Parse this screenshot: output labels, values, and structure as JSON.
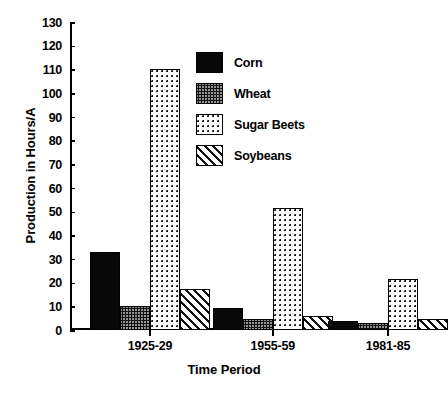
{
  "chart_data": {
    "type": "bar",
    "title": "",
    "xlabel": "Time Period",
    "ylabel": "Production in Hours/A",
    "categories": [
      "1925-29",
      "1955-59",
      "1981-85"
    ],
    "ylim": [
      0,
      130
    ],
    "yticks": [
      0,
      10,
      20,
      30,
      40,
      50,
      60,
      70,
      80,
      90,
      100,
      110,
      120,
      130
    ],
    "grid": false,
    "legend_position": "upper-center",
    "series": [
      {
        "name": "Corn",
        "pattern": "solid-black",
        "values": [
          33,
          9.5,
          4
        ]
      },
      {
        "name": "Wheat",
        "pattern": "dense-crosshatch",
        "values": [
          10,
          4.5,
          3
        ]
      },
      {
        "name": "Sugar Beets",
        "pattern": "sparse-dots",
        "values": [
          110,
          51.5,
          21.5
        ]
      },
      {
        "name": "Soybeans",
        "pattern": "diagonal-hatch",
        "values": [
          17.5,
          6,
          4.5
        ]
      }
    ]
  }
}
